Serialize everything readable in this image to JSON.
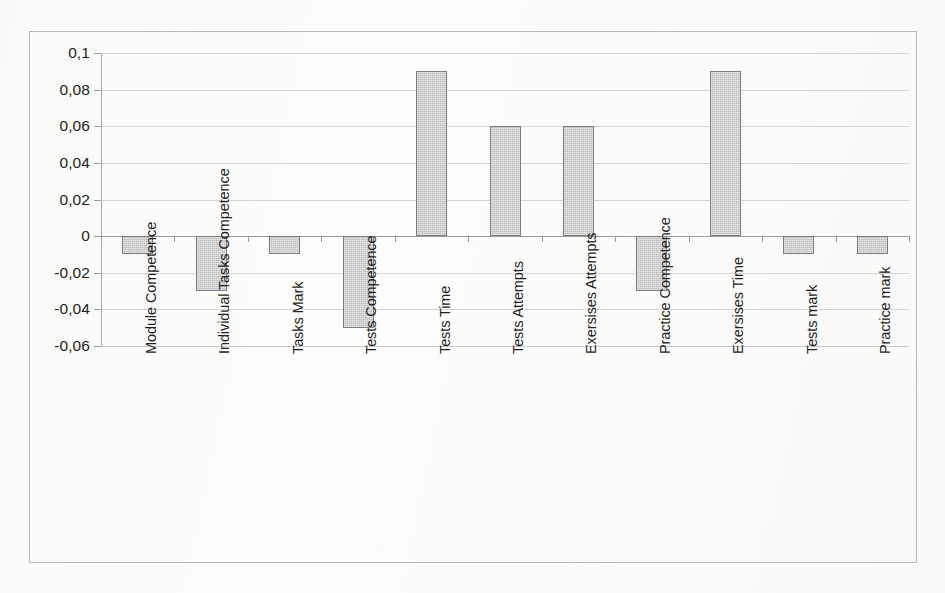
{
  "chart_data": {
    "type": "bar",
    "title": "",
    "subtitle": "",
    "xlabel": "",
    "ylabel": "",
    "orientation": "vertical",
    "grid": true,
    "legend": false,
    "legend_position": "none",
    "decimal_separator": ",",
    "ylim": [
      -0.06,
      0.1
    ],
    "ytick_step": 0.02,
    "ytick_labels": [
      "0,1",
      "0,08",
      "0,06",
      "0,04",
      "0,02",
      "0",
      "-0,02",
      "-0,04",
      "-0,06"
    ],
    "ytick_values": [
      0.1,
      0.08,
      0.06,
      0.04,
      0.02,
      0,
      -0.02,
      -0.04,
      -0.06
    ],
    "categories": [
      "Module Competence",
      "Individual Tasks Competence",
      "Tasks Mark",
      "Tests Competence",
      "Tests Time",
      "Tests Attempts",
      "Exersises Attempts",
      "Practice Competence",
      "Exersises Time",
      "Tests mark",
      "Practice mark"
    ],
    "values": [
      -0.01,
      -0.03,
      -0.01,
      -0.05,
      0.09,
      0.06,
      0.06,
      -0.03,
      0.09,
      -0.01,
      -0.01
    ],
    "colors": {
      "bar_fill": "#c9c9c9",
      "bar_border": "#7d7d7d",
      "gridline": "#d4d4d4",
      "axis": "#9a9a9a",
      "frame": "#b9b9b9",
      "text": "#231f20",
      "background": "#fdfdfc"
    }
  }
}
